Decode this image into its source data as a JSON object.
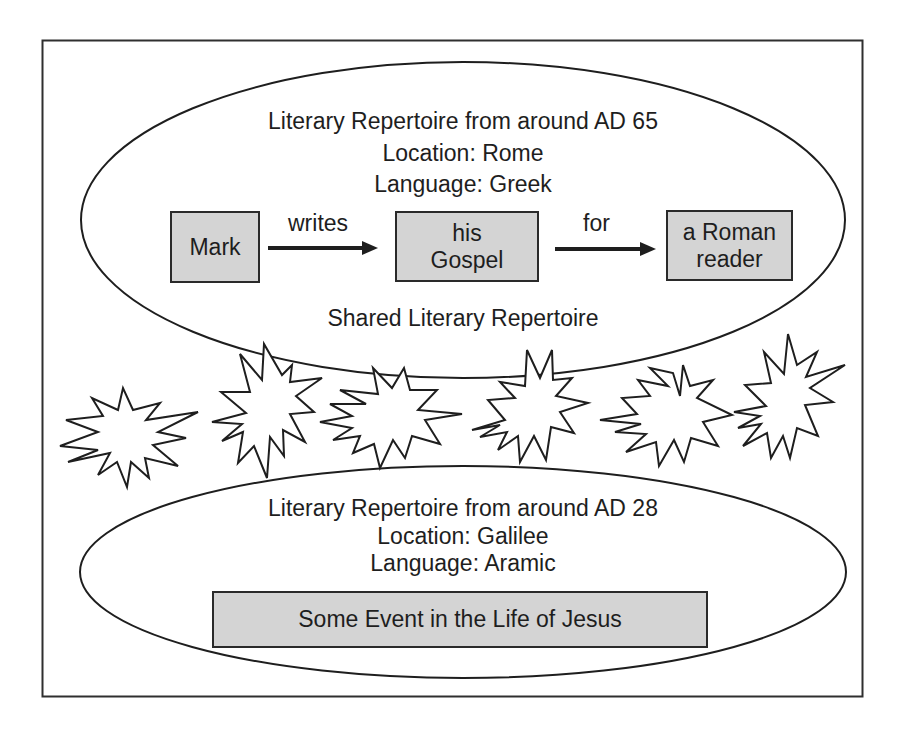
{
  "diagram": {
    "upper_repertoire": {
      "title": "Literary Repertoire from around AD 65",
      "location": "Location: Rome",
      "language": "Language: Greek",
      "flow": {
        "nodes": [
          {
            "id": "mark",
            "label": "Mark"
          },
          {
            "id": "gospel",
            "line1": "his",
            "line2": "Gospel"
          },
          {
            "id": "reader",
            "line1": "a Roman",
            "line2": "reader"
          }
        ],
        "edges": [
          {
            "from": "mark",
            "to": "gospel",
            "label": "writes"
          },
          {
            "from": "gospel",
            "to": "reader",
            "label": "for"
          }
        ]
      },
      "footer": "Shared Literary Repertoire"
    },
    "lower_repertoire": {
      "title": "Literary Repertoire from around AD 28",
      "location": "Location: Galilee",
      "language": "Language: Aramic",
      "event": "Some Event in the Life of Jesus"
    },
    "separator": {
      "starburst_count": 6
    },
    "colors": {
      "box_fill": "#d4d4d4",
      "stroke": "#2a2a2a",
      "background": "#ffffff"
    }
  }
}
